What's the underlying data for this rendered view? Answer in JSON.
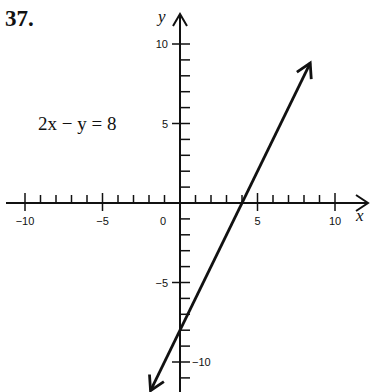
{
  "problem_number": "37.",
  "equation_label": "2x − y = 8",
  "chart_data": {
    "type": "line",
    "title": "2x − y = 8",
    "xlabel": "x",
    "ylabel": "y",
    "xlim": [
      -11,
      11
    ],
    "ylim": [
      -12,
      11
    ],
    "x_ticks_labeled": [
      -10,
      -5,
      0,
      5,
      10
    ],
    "y_ticks_labeled": [
      10,
      5,
      -5,
      -10
    ],
    "x_tick_labels": [
      "−10",
      "−5",
      "0",
      "5",
      "10"
    ],
    "y_tick_labels": [
      "10",
      "5",
      "−5",
      "−10"
    ],
    "minor_tick_step": 1,
    "grid": false,
    "series": [
      {
        "name": "2x − y = 8",
        "equation": "y = 2x − 8",
        "x": [
          -1.9,
          0,
          4,
          8.4
        ],
        "y": [
          -11.8,
          -8,
          0,
          8.8
        ],
        "arrows_both_ends": true
      }
    ],
    "intercepts": {
      "x_intercept": 4,
      "y_intercept": -8
    },
    "line_color": "#111111"
  }
}
